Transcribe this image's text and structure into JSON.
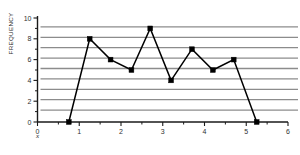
{
  "chart_data": {
    "type": "line",
    "title": "",
    "subtitle": "",
    "xlabel": "x",
    "ylabel": "FREQUENCY",
    "xlim": [
      0,
      6
    ],
    "ylim": [
      0,
      10
    ],
    "grid": true,
    "grid_orientation": "horizontal",
    "legend": "none",
    "x_ticks": [
      0,
      1,
      2,
      3,
      4,
      5,
      6
    ],
    "x_tick_labels": [
      "0",
      "1",
      "2",
      "3",
      "4",
      "5",
      "6"
    ],
    "y_ticks": [
      0,
      2,
      4,
      6,
      8,
      10
    ],
    "y_tick_labels": [
      "0",
      "2",
      "4",
      "6",
      "8",
      "10"
    ],
    "x_minor_ticks": [
      0.5,
      1.5,
      2.5,
      3.5,
      4.5,
      5.5
    ],
    "y_minor_ticks": [
      1,
      3,
      5,
      7,
      9
    ],
    "gridline_values": [
      1,
      2,
      3,
      4,
      5,
      6,
      7,
      8,
      9
    ],
    "marker": "square",
    "marker_color": "#000000",
    "line_color": "#000000",
    "grid_color": "#8c8c8c",
    "axis_color": "#1a1a1a",
    "x": [
      0.75,
      1.25,
      1.75,
      2.25,
      2.7,
      3.2,
      3.7,
      4.2,
      4.7,
      5.25
    ],
    "values": [
      0,
      8,
      6,
      5,
      9,
      4,
      7,
      5,
      6,
      0
    ],
    "series": [
      {
        "name": "Frequency polygon",
        "x": [
          0.75,
          1.25,
          1.75,
          2.25,
          2.7,
          3.2,
          3.7,
          4.2,
          4.7,
          5.25
        ],
        "values": [
          0,
          8,
          6,
          5,
          9,
          4,
          7,
          5,
          6,
          0
        ]
      }
    ]
  }
}
